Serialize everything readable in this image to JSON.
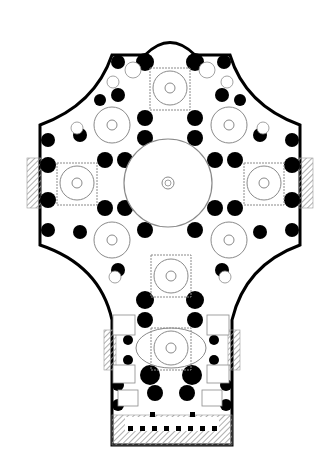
{
  "diagram": {
    "type": "architectural-floor-plan",
    "background": "#ffffff",
    "colors": {
      "wall": "#000000",
      "line": "#8a8a8a",
      "hatch": "#9a9a9a"
    },
    "central_dome": {
      "cx": 168,
      "cy": 183,
      "r": 44
    },
    "domes": [
      {
        "name": "north",
        "cx": 170,
        "cy": 88
      },
      {
        "name": "north-west",
        "cx": 112,
        "cy": 125
      },
      {
        "name": "north-east",
        "cx": 229,
        "cy": 125
      },
      {
        "name": "west",
        "cx": 77,
        "cy": 183
      },
      {
        "name": "east",
        "cx": 264,
        "cy": 183
      },
      {
        "name": "south-west",
        "cx": 112,
        "cy": 240
      },
      {
        "name": "south-east",
        "cx": 229,
        "cy": 240
      },
      {
        "name": "south",
        "cx": 171,
        "cy": 276
      },
      {
        "name": "nave",
        "cx": 171,
        "cy": 348
      }
    ],
    "portico_columns": 8
  }
}
